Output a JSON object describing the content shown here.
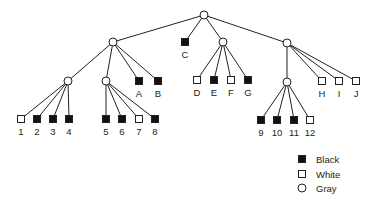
{
  "colors": {
    "black": "#111111",
    "white": "#ffffff",
    "stroke": "#222222",
    "background": "#ffffff"
  },
  "nodes": [
    {
      "id": "root",
      "type": "gray",
      "x": 204,
      "y": 15
    },
    {
      "id": "L",
      "type": "gray",
      "x": 113,
      "y": 42,
      "parent": "root"
    },
    {
      "id": "C",
      "type": "black",
      "x": 185,
      "y": 42,
      "parent": "root",
      "label": "C"
    },
    {
      "id": "M",
      "type": "gray",
      "x": 223,
      "y": 42,
      "parent": "root"
    },
    {
      "id": "R",
      "type": "gray",
      "x": 287,
      "y": 43,
      "parent": "root"
    },
    {
      "id": "LL",
      "type": "gray",
      "x": 68,
      "y": 81,
      "parent": "L"
    },
    {
      "id": "LM",
      "type": "gray",
      "x": 106,
      "y": 81,
      "parent": "L"
    },
    {
      "id": "A",
      "type": "black",
      "x": 139,
      "y": 81,
      "parent": "L",
      "label": "A"
    },
    {
      "id": "B",
      "type": "black",
      "x": 158,
      "y": 81,
      "parent": "L",
      "label": "B"
    },
    {
      "id": "D",
      "type": "white",
      "x": 197,
      "y": 80,
      "parent": "M",
      "label": "D"
    },
    {
      "id": "E",
      "type": "black",
      "x": 214,
      "y": 80,
      "parent": "M",
      "label": "E"
    },
    {
      "id": "F",
      "type": "white",
      "x": 231,
      "y": 80,
      "parent": "M",
      "label": "F"
    },
    {
      "id": "G",
      "type": "black",
      "x": 248,
      "y": 80,
      "parent": "M",
      "label": "G"
    },
    {
      "id": "RI",
      "type": "gray",
      "x": 287,
      "y": 82,
      "parent": "R"
    },
    {
      "id": "H",
      "type": "white",
      "x": 322,
      "y": 81,
      "parent": "R",
      "label": "H"
    },
    {
      "id": "I",
      "type": "white",
      "x": 339,
      "y": 81,
      "parent": "R",
      "label": "I"
    },
    {
      "id": "J",
      "type": "white",
      "x": 356,
      "y": 81,
      "parent": "R",
      "label": "J"
    },
    {
      "id": "n1",
      "type": "white",
      "x": 21,
      "y": 119,
      "parent": "LL",
      "label": "1"
    },
    {
      "id": "n2",
      "type": "black",
      "x": 37,
      "y": 119,
      "parent": "LL",
      "label": "2"
    },
    {
      "id": "n3",
      "type": "black",
      "x": 53,
      "y": 119,
      "parent": "LL",
      "label": "3"
    },
    {
      "id": "n4",
      "type": "black",
      "x": 69,
      "y": 119,
      "parent": "LL",
      "label": "4"
    },
    {
      "id": "n5",
      "type": "black",
      "x": 106,
      "y": 119,
      "parent": "LM",
      "label": "5"
    },
    {
      "id": "n6",
      "type": "black",
      "x": 122,
      "y": 119,
      "parent": "LM",
      "label": "6"
    },
    {
      "id": "n7",
      "type": "white",
      "x": 139,
      "y": 119,
      "parent": "LM",
      "label": "7"
    },
    {
      "id": "n8",
      "type": "black",
      "x": 155,
      "y": 119,
      "parent": "LM",
      "label": "8"
    },
    {
      "id": "n9",
      "type": "black",
      "x": 261,
      "y": 120,
      "parent": "RI",
      "label": "9"
    },
    {
      "id": "n10",
      "type": "black",
      "x": 277,
      "y": 120,
      "parent": "RI",
      "label": "10"
    },
    {
      "id": "n11",
      "type": "black",
      "x": 294,
      "y": 120,
      "parent": "RI",
      "label": "11"
    },
    {
      "id": "n12",
      "type": "white",
      "x": 310,
      "y": 120,
      "parent": "RI",
      "label": "12"
    }
  ],
  "legend": {
    "items": [
      {
        "shape": "black-square",
        "label": "Black",
        "x": 302,
        "y": 159
      },
      {
        "shape": "white-square",
        "label": "White",
        "x": 302,
        "y": 174
      },
      {
        "shape": "circle",
        "label": "Gray",
        "x": 302,
        "y": 188
      }
    ]
  }
}
